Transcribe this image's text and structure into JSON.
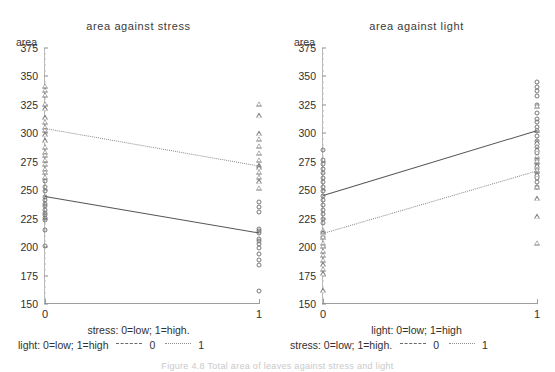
{
  "figure": {
    "caption": "Figure 4.8  Total area of leaves against stress and light",
    "background": "#ffffff",
    "ink_color": "#2b2b2b"
  },
  "chart_data": [
    {
      "type": "line",
      "panel_id": "left",
      "title": "area against stress",
      "ylabel": "area",
      "xlabel": "stress:   0=low; 1=high.",
      "legend_title": "light:  0=low; 1=high",
      "x": [
        0,
        1
      ],
      "xticklabels": [
        "0",
        "1"
      ],
      "xlim": [
        0,
        1
      ],
      "ylim": [
        150,
        375
      ],
      "yticks": [
        150,
        175,
        200,
        225,
        250,
        275,
        300,
        325,
        350,
        375
      ],
      "grid": false,
      "legend_position": "below-axis",
      "series": [
        {
          "name": "0",
          "linestyle": "solid",
          "marker": "circle",
          "values": [
            245,
            213
          ],
          "points_x0": [
            258,
            253,
            249,
            244,
            241,
            238,
            236,
            233,
            230,
            228,
            226,
            224,
            215,
            201
          ],
          "points_x1": [
            240,
            235,
            231,
            216,
            214,
            212,
            207,
            205,
            203,
            199,
            194,
            189,
            184,
            161
          ]
        },
        {
          "name": "1",
          "linestyle": "dotted",
          "marker": "triangle",
          "values": [
            305,
            272
          ],
          "points_x0": [
            342,
            338,
            334,
            326,
            322,
            314,
            310,
            306,
            303,
            299,
            294,
            288,
            284,
            281,
            277,
            273,
            269
          ],
          "points_x1": [
            326,
            316,
            300,
            295,
            289,
            283,
            277,
            272,
            270,
            266,
            262,
            258,
            252
          ],
          "points_x0_extra": [
            266,
            262
          ]
        }
      ]
    },
    {
      "type": "line",
      "panel_id": "right",
      "title": "area against light",
      "ylabel": "area",
      "xlabel": "light:  0=low; 1=high",
      "legend_title": "stress:   0=low; 1=high.",
      "x": [
        0,
        1
      ],
      "xticklabels": [
        "0",
        "1"
      ],
      "xlim": [
        0,
        1
      ],
      "ylim": [
        150,
        375
      ],
      "yticks": [
        150,
        175,
        200,
        225,
        250,
        275,
        300,
        325,
        350,
        375
      ],
      "grid": false,
      "legend_position": "below-axis",
      "series": [
        {
          "name": "0",
          "linestyle": "solid",
          "marker": "circle",
          "values": [
            246,
            303
          ],
          "points_x0": [
            285,
            277,
            273,
            269,
            265,
            261,
            257,
            253,
            249,
            245,
            241,
            237,
            233,
            229,
            225,
            221
          ],
          "points_x1": [
            345,
            341,
            337,
            333,
            325,
            318,
            313,
            310,
            306,
            302,
            298,
            293,
            288,
            283,
            277,
            273,
            269,
            265,
            261,
            257,
            253
          ]
        },
        {
          "name": "1",
          "linestyle": "dotted",
          "marker": "triangle",
          "values": [
            212,
            267
          ],
          "points_x0": [
            215,
            213,
            211,
            209,
            204,
            201,
            197,
            193,
            189,
            185,
            181,
            177,
            162
          ],
          "points_x1": [
            324,
            303,
            292,
            286,
            280,
            276,
            272,
            268,
            264,
            253,
            243,
            227,
            204
          ]
        }
      ]
    }
  ],
  "panels": [
    {
      "title": "area against stress",
      "ylabel": "area",
      "xaxis_caption": "stress:   0=low; 1=high.",
      "legend": {
        "label": "light:  0=low; 1=high",
        "entries": [
          {
            "key": "dashed",
            "label": "0"
          },
          {
            "key": "dotted",
            "label": "1"
          }
        ]
      },
      "yticks": [
        "375",
        "350",
        "325",
        "300",
        "275",
        "250",
        "225",
        "200",
        "175",
        "150"
      ],
      "xticks": [
        "0",
        "1"
      ]
    },
    {
      "title": "area against light",
      "ylabel": "area",
      "xaxis_caption": "light:  0=low; 1=high",
      "legend": {
        "label": "stress:   0=low; 1=high.",
        "entries": [
          {
            "key": "dashed",
            "label": "0"
          },
          {
            "key": "dotted",
            "label": "1"
          }
        ]
      },
      "yticks": [
        "375",
        "350",
        "325",
        "300",
        "275",
        "250",
        "225",
        "200",
        "175",
        "150"
      ],
      "xticks": [
        "0",
        "1"
      ]
    }
  ]
}
